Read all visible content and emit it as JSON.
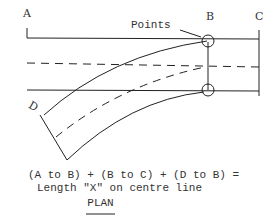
{
  "labels": {
    "a": "A",
    "b": "B",
    "c": "C",
    "d": "D",
    "points": "Points"
  },
  "caption": {
    "line1": "(A to B) + (B to C) + (D to B) =",
    "line2": "Length \"X\" on centre line",
    "title": "PLAN"
  },
  "colors": {
    "ink": "#222222",
    "background": "#ffffff"
  }
}
